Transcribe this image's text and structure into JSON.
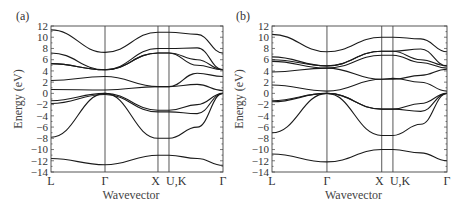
{
  "chart_data": [
    {
      "type": "line",
      "panel_label": "(a)",
      "title": "",
      "xlabel": "Wavevector",
      "ylabel": "Energy (eV)",
      "ylim": [
        -14,
        12
      ],
      "yticks": [
        12,
        10,
        8,
        6,
        4,
        2,
        0,
        -2,
        -4,
        -6,
        -8,
        -10,
        -12,
        -14
      ],
      "k_points": [
        "L",
        "Γ",
        "X",
        "U,K",
        "Γ"
      ],
      "k_positions": [
        0,
        0.314,
        0.622,
        0.686,
        1.0
      ],
      "grid": false,
      "series": [
        {
          "name": "band1",
          "k": [
            0,
            0.314,
            0.622,
            0.686,
            0.85,
            1.0
          ],
          "E": [
            -11.6,
            -12.7,
            -11.0,
            -11.0,
            -11.6,
            -12.8
          ]
        },
        {
          "name": "band2",
          "k": [
            0,
            0.314,
            0.622,
            0.686,
            0.85,
            1.0
          ],
          "E": [
            -7.8,
            0.0,
            -8.0,
            -8.0,
            -6.0,
            0.0
          ]
        },
        {
          "name": "band3",
          "k": [
            0,
            0.314,
            0.622,
            0.686,
            0.85,
            1.0
          ],
          "E": [
            -1.8,
            -0.2,
            -3.3,
            -3.3,
            -3.6,
            0.0
          ]
        },
        {
          "name": "band4",
          "k": [
            0,
            0.314,
            0.622,
            0.686,
            0.85,
            1.0
          ],
          "E": [
            -1.3,
            0.0,
            -3.0,
            -3.0,
            -2.0,
            0.0
          ]
        },
        {
          "name": "band5",
          "k": [
            0,
            0.314,
            0.622,
            0.686,
            0.85,
            1.0
          ],
          "E": [
            0.7,
            0.6,
            1.2,
            1.2,
            1.6,
            0.5
          ]
        },
        {
          "name": "band6",
          "k": [
            0,
            0.314,
            0.622,
            0.686,
            0.85,
            1.0
          ],
          "E": [
            2.3,
            3.0,
            1.2,
            1.2,
            3.6,
            3.0
          ]
        },
        {
          "name": "band7",
          "k": [
            0,
            0.314,
            0.622,
            0.686,
            0.85,
            1.0
          ],
          "E": [
            5.3,
            4.2,
            7.2,
            7.2,
            5.0,
            4.2
          ]
        },
        {
          "name": "band8",
          "k": [
            0,
            0.314,
            0.622,
            0.686,
            0.85,
            1.0
          ],
          "E": [
            5.3,
            4.2,
            7.2,
            7.2,
            6.0,
            4.2
          ]
        },
        {
          "name": "band9",
          "k": [
            0,
            0.314,
            0.622,
            0.686,
            0.85,
            1.0
          ],
          "E": [
            7.2,
            4.2,
            8.0,
            8.0,
            8.1,
            4.2
          ]
        },
        {
          "name": "band10",
          "k": [
            0,
            0.314,
            0.622,
            0.686,
            0.85,
            1.0
          ],
          "E": [
            11.3,
            7.3,
            10.9,
            10.9,
            10.5,
            7.2
          ]
        }
      ]
    },
    {
      "type": "line",
      "panel_label": "(b)",
      "title": "",
      "xlabel": "Wavevector",
      "ylabel": "Energy (eV)",
      "ylim": [
        -14,
        12
      ],
      "yticks": [
        12,
        10,
        8,
        6,
        4,
        2,
        0,
        -2,
        -4,
        -6,
        -8,
        -10,
        -12,
        -14
      ],
      "k_points": [
        "L",
        "Γ",
        "X",
        "U,K",
        "Γ"
      ],
      "k_positions": [
        0,
        0.314,
        0.627,
        0.691,
        1.0
      ],
      "grid": false,
      "series": [
        {
          "name": "band1",
          "k": [
            0,
            0.314,
            0.627,
            0.691,
            0.85,
            1.0
          ],
          "E": [
            -10.8,
            -12.2,
            -10.0,
            -10.0,
            -10.6,
            -12.0
          ]
        },
        {
          "name": "band2",
          "k": [
            0,
            0.314,
            0.627,
            0.691,
            0.85,
            1.0
          ],
          "E": [
            -7.0,
            0.0,
            -7.5,
            -7.5,
            -5.5,
            0.0
          ]
        },
        {
          "name": "band3",
          "k": [
            0,
            0.314,
            0.627,
            0.691,
            0.85,
            1.0
          ],
          "E": [
            -1.5,
            0.0,
            -2.8,
            -2.8,
            -3.2,
            0.0
          ]
        },
        {
          "name": "band4",
          "k": [
            0,
            0.314,
            0.627,
            0.691,
            0.85,
            1.0
          ],
          "E": [
            -1.3,
            0.0,
            -2.8,
            -2.8,
            -1.8,
            0.0
          ]
        },
        {
          "name": "band5",
          "k": [
            0,
            0.314,
            0.627,
            0.691,
            0.85,
            1.0
          ],
          "E": [
            1.5,
            0.4,
            2.5,
            2.5,
            3.2,
            4.3
          ]
        },
        {
          "name": "band6",
          "k": [
            0,
            0.314,
            0.627,
            0.691,
            0.85,
            1.0
          ],
          "E": [
            3.8,
            4.5,
            2.5,
            2.7,
            2.0,
            0.4
          ]
        },
        {
          "name": "band7",
          "k": [
            0,
            0.314,
            0.627,
            0.691,
            0.85,
            1.0
          ],
          "E": [
            5.7,
            4.5,
            6.8,
            6.8,
            5.5,
            4.5
          ]
        },
        {
          "name": "band8",
          "k": [
            0,
            0.314,
            0.627,
            0.691,
            0.85,
            1.0
          ],
          "E": [
            6.0,
            4.9,
            7.5,
            7.5,
            6.0,
            4.9
          ]
        },
        {
          "name": "band9",
          "k": [
            0,
            0.314,
            0.627,
            0.691,
            0.85,
            1.0
          ],
          "E": [
            6.5,
            4.9,
            7.5,
            7.5,
            7.9,
            4.9
          ]
        },
        {
          "name": "band10",
          "k": [
            0,
            0.314,
            0.627,
            0.691,
            0.85,
            1.0
          ],
          "E": [
            10.5,
            7.4,
            10.0,
            10.0,
            9.7,
            7.4
          ]
        }
      ]
    }
  ],
  "panels": [
    {
      "label": "(a)",
      "xlabel": "Wavevector",
      "ylabel": "Energy (eV)",
      "k_labels": [
        "L",
        "Γ",
        "X",
        "U,K",
        "Γ"
      ]
    },
    {
      "label": "(b)",
      "xlabel": "Wavevector",
      "ylabel": "Energy (eV)",
      "k_labels": [
        "L",
        "Γ",
        "X",
        "U,K",
        "Γ"
      ]
    }
  ],
  "y_tick_labels": [
    "12",
    "10",
    "8",
    "6",
    "4",
    "2",
    "0",
    "−2",
    "−4",
    "−6",
    "−8",
    "−10",
    "−12",
    "−14"
  ]
}
